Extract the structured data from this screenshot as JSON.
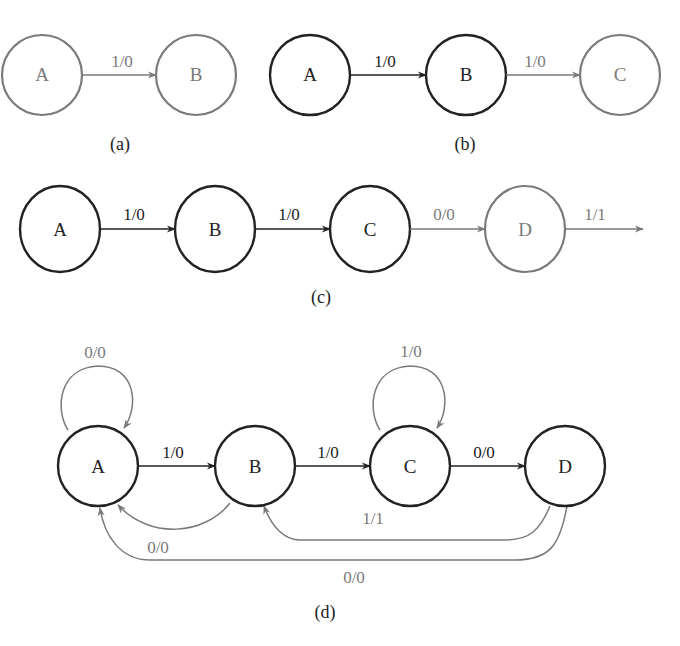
{
  "colors": {
    "dark": "#222222",
    "grey": "#7a7a7a",
    "background": "#ffffff"
  },
  "diagram_a": {
    "caption": "(a)",
    "nodes": [
      {
        "id": "A",
        "label": "A",
        "style": "grey"
      },
      {
        "id": "B",
        "label": "B",
        "style": "grey"
      }
    ],
    "edges": [
      {
        "from": "A",
        "to": "B",
        "label": "1/0",
        "style": "grey"
      }
    ]
  },
  "diagram_b": {
    "caption": "(b)",
    "nodes": [
      {
        "id": "A",
        "label": "A",
        "style": "dark"
      },
      {
        "id": "B",
        "label": "B",
        "style": "dark"
      },
      {
        "id": "C",
        "label": "C",
        "style": "grey"
      }
    ],
    "edges": [
      {
        "from": "A",
        "to": "B",
        "label": "1/0",
        "style": "dark"
      },
      {
        "from": "B",
        "to": "C",
        "label": "1/0",
        "style": "grey"
      }
    ]
  },
  "diagram_c": {
    "caption": "(c)",
    "nodes": [
      {
        "id": "A",
        "label": "A",
        "style": "dark"
      },
      {
        "id": "B",
        "label": "B",
        "style": "dark"
      },
      {
        "id": "C",
        "label": "C",
        "style": "dark"
      },
      {
        "id": "D",
        "label": "D",
        "style": "grey"
      }
    ],
    "edges": [
      {
        "from": "A",
        "to": "B",
        "label": "1/0",
        "style": "dark"
      },
      {
        "from": "B",
        "to": "C",
        "label": "1/0",
        "style": "dark"
      },
      {
        "from": "C",
        "to": "D",
        "label": "0/0",
        "style": "grey"
      },
      {
        "from": "D",
        "to": "out",
        "label": "1/1",
        "style": "grey"
      }
    ]
  },
  "diagram_d": {
    "caption": "(d)",
    "nodes": [
      {
        "id": "A",
        "label": "A",
        "style": "dark"
      },
      {
        "id": "B",
        "label": "B",
        "style": "dark"
      },
      {
        "id": "C",
        "label": "C",
        "style": "dark"
      },
      {
        "id": "D",
        "label": "D",
        "style": "dark"
      }
    ],
    "edges": [
      {
        "from": "A",
        "to": "A",
        "label": "0/0",
        "style": "grey"
      },
      {
        "from": "A",
        "to": "B",
        "label": "1/0",
        "style": "dark"
      },
      {
        "from": "B",
        "to": "C",
        "label": "1/0",
        "style": "dark"
      },
      {
        "from": "C",
        "to": "C",
        "label": "1/0",
        "style": "grey"
      },
      {
        "from": "C",
        "to": "D",
        "label": "0/0",
        "style": "dark"
      },
      {
        "from": "B",
        "to": "A",
        "label": "0/0",
        "style": "grey"
      },
      {
        "from": "D",
        "to": "B",
        "label": "1/1",
        "style": "grey"
      },
      {
        "from": "D",
        "to": "A",
        "label": "0/0",
        "style": "grey"
      }
    ]
  }
}
